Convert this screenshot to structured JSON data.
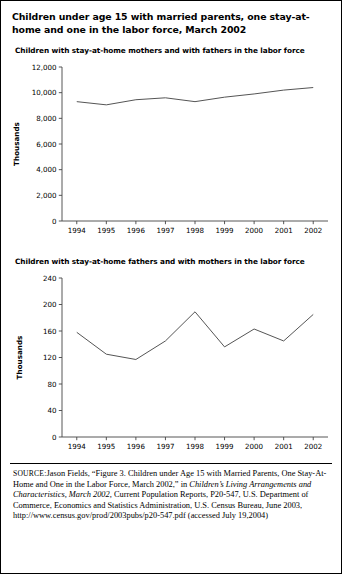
{
  "figure": {
    "title": "Children under age 15 with married parents, one stay-at-home and one in the labor force, March 2002",
    "source_label": "SOURCE:",
    "source_text_1": "Jason Fields, “Figure 3. Children under Age 15 with Married Parents, One Stay-At-Home and One in the Labor Force, March 2002,” in ",
    "source_italic": "Children’s Living Arrangements and Characteristics, March 2002,",
    "source_text_2": " Current Population Reports, P20-547, U.S. Department of Commerce, Economics and Statistics Administration, U.S. Census Bureau, June 2003, http://www.census.gov/prod/2003pubs/p20-547.pdf (accessed July 19,2004)"
  },
  "chart_data": [
    {
      "type": "line",
      "title": "Children with stay-at-home mothers and with fathers in the labor force",
      "xlabel": "",
      "ylabel": "Thousands",
      "categories": [
        "1994",
        "1995",
        "1996",
        "1997",
        "1998",
        "1999",
        "2000",
        "2001",
        "2002"
      ],
      "x": [
        1994,
        1995,
        1996,
        1997,
        1998,
        1999,
        2000,
        2001,
        2002
      ],
      "values": [
        9300,
        9050,
        9450,
        9600,
        9300,
        9650,
        9900,
        10200,
        10400
      ],
      "ylim": [
        0,
        12000
      ],
      "yticks": [
        0,
        2000,
        4000,
        6000,
        8000,
        10000,
        12000
      ],
      "ytick_labels": [
        "0",
        "2,000",
        "4,000",
        "6,000",
        "8,000",
        "10,000",
        "12,000"
      ],
      "grid": false,
      "legend": "none",
      "line_color": "#555555"
    },
    {
      "type": "line",
      "title": "Children with stay-at-home fathers and with mothers in the labor force",
      "xlabel": "",
      "ylabel": "Thousands",
      "categories": [
        "1994",
        "1995",
        "1996",
        "1997",
        "1998",
        "1999",
        "2000",
        "2001",
        "2002"
      ],
      "x": [
        1994,
        1995,
        1996,
        1997,
        1998,
        1999,
        2000,
        2001,
        2002
      ],
      "values": [
        158,
        125,
        117,
        145,
        189,
        136,
        163,
        145,
        185
      ],
      "ylim": [
        0,
        240
      ],
      "yticks": [
        0,
        40,
        80,
        120,
        160,
        200,
        240
      ],
      "ytick_labels": [
        "0",
        "40",
        "80",
        "120",
        "160",
        "200",
        "240"
      ],
      "grid": false,
      "legend": "none",
      "line_color": "#555555"
    }
  ]
}
